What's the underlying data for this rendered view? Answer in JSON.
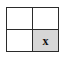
{
  "canvas": {
    "width": 68,
    "height": 59,
    "background_color": "#ffffff"
  },
  "grid": {
    "name": "two-by-two-grid",
    "rows": 2,
    "columns": 2,
    "line_color": "#2b2b2b",
    "line_width_px": 1,
    "cell_background_color": "#ffffff",
    "highlight_background_color": "#d6d6d6",
    "mark_color": "#111111",
    "cells": [
      {
        "row": 0,
        "column": 0,
        "position": "top-left",
        "mark": "",
        "filled": false
      },
      {
        "row": 0,
        "column": 1,
        "position": "top-right",
        "mark": "",
        "filled": false
      },
      {
        "row": 1,
        "column": 0,
        "position": "bottom-left",
        "mark": "",
        "filled": false
      },
      {
        "row": 1,
        "column": 1,
        "position": "bottom-right",
        "mark": "x",
        "filled": true
      }
    ]
  }
}
